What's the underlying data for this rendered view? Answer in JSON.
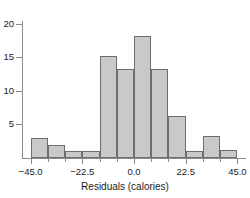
{
  "chart_data": {
    "type": "bar",
    "title": "",
    "xlabel": "Residuals (calories)",
    "ylabel": "",
    "xlim": [
      -48.75,
      48.75
    ],
    "ylim": [
      0,
      20.5
    ],
    "grid": false,
    "legend": "none",
    "bin_width": 7.5,
    "x_ticks": [
      -45.0,
      -22.5,
      0.0,
      22.5,
      45.0
    ],
    "x_tick_labels": [
      "−45.0",
      "−22.5",
      "0.0",
      "22.5",
      "45.0"
    ],
    "x_minor_ticks": [
      -45.0,
      -37.5,
      -30.0,
      -22.5,
      -15.0,
      -7.5,
      0.0,
      7.5,
      15.0,
      22.5,
      30.0,
      37.5,
      45.0
    ],
    "y_ticks": [
      5,
      10,
      15,
      20
    ],
    "y_tick_labels": [
      "5",
      "10",
      "15",
      "20"
    ],
    "bin_starts": [
      -45.0,
      -37.5,
      -30.0,
      -22.5,
      -15.0,
      -7.5,
      0.0,
      7.5,
      15.0,
      22.5,
      30.0,
      37.5
    ],
    "bin_ends": [
      -37.5,
      -30.0,
      -22.5,
      -15.0,
      -7.5,
      0.0,
      7.5,
      15.0,
      22.5,
      30.0,
      37.5,
      45.0
    ],
    "categories": [
      "-45.0 to -37.5",
      "-37.5 to -30.0",
      "-30.0 to -22.5",
      "-22.5 to -15.0",
      "-15.0 to -7.5",
      "-7.5 to 0.0",
      "0.0 to 7.5",
      "7.5 to 15.0",
      "15.0 to 22.5",
      "22.5 to 30.0",
      "30.0 to 37.5",
      "37.5 to 45.0"
    ],
    "values": [
      3.0,
      2.0,
      1.0,
      1.0,
      15.2,
      13.2,
      18.1,
      13.3,
      6.3,
      1.0,
      3.3,
      1.2
    ],
    "bar_fill_color": "#c9c9c9",
    "bar_edge_color": "#6e6e6e",
    "axis_color": "#8a8a8a",
    "text_color": "#1a1a1a",
    "background_color": "#ffffff"
  }
}
